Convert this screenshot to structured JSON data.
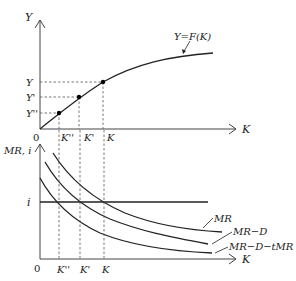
{
  "top_panel": {
    "y_axis_label": "Y",
    "x_axis_label": "K",
    "origin_label": "0",
    "curve_label": "Y=F(K)",
    "y_ticks": [
      "Y",
      "Y'",
      "Y''"
    ],
    "x_ticks": [
      "K''",
      "K'",
      "K"
    ]
  },
  "bottom_panel": {
    "y_axis_label": "MR, i",
    "x_axis_label": "K",
    "origin_label": "0",
    "i_label": "i",
    "x_ticks": [
      "K''",
      "K'",
      "K"
    ],
    "curves": [
      {
        "label": "MR"
      },
      {
        "label": "MR−D"
      },
      {
        "label": "MR−D−tMR"
      }
    ]
  },
  "colors": {
    "line": "#222222",
    "background": "#ffffff"
  }
}
